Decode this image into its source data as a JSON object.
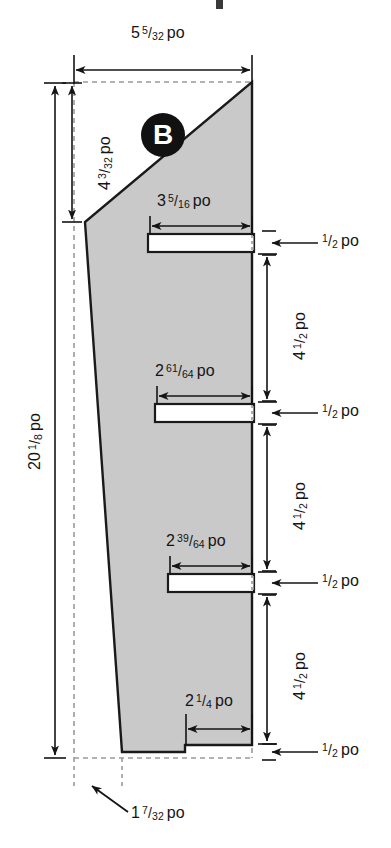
{
  "drawing": {
    "title": "",
    "part_label": "B",
    "unit": "po",
    "shape_fill": "#c9c9c9",
    "shape_stroke": "#1a1a1a",
    "hidden_line_color": "#9a9a9a",
    "dimension_color": "#141414",
    "badge_color": "#111111"
  },
  "dimensions": {
    "overall_width": {
      "whole": "5",
      "num": "5",
      "den": "32",
      "unit": "po",
      "text": "5 5/32 po"
    },
    "overall_height": {
      "whole": "20",
      "num": "1",
      "den": "8",
      "unit": "po",
      "text": "20 1/8 po"
    },
    "top_offset_height": {
      "whole": "4",
      "num": "3",
      "den": "32",
      "unit": "po",
      "text": "4 3/32 po"
    },
    "slot1_length": {
      "whole": "3",
      "num": "5",
      "den": "16",
      "unit": "po",
      "text": "3 5/16 po"
    },
    "slot2_length": {
      "whole": "2",
      "num": "61",
      "den": "64",
      "unit": "po",
      "text": "2 61/64 po"
    },
    "slot3_length": {
      "whole": "2",
      "num": "39",
      "den": "64",
      "unit": "po",
      "text": "2 39/64 po"
    },
    "notch_length": {
      "whole": "2",
      "num": "1",
      "den": "4",
      "unit": "po",
      "text": "2 1/4 po"
    },
    "bottom_offset": {
      "whole": "1",
      "num": "7",
      "den": "32",
      "unit": "po",
      "text": "1 7/32 po"
    },
    "slot_width_1": {
      "whole": "",
      "num": "1",
      "den": "2",
      "unit": "po",
      "text": "1/2 po"
    },
    "slot_width_2": {
      "whole": "",
      "num": "1",
      "den": "2",
      "unit": "po",
      "text": "1/2 po"
    },
    "slot_width_3": {
      "whole": "",
      "num": "1",
      "den": "2",
      "unit": "po",
      "text": "1/2 po"
    },
    "slot_width_4": {
      "whole": "",
      "num": "1",
      "den": "2",
      "unit": "po",
      "text": "1/2 po"
    },
    "spacing_1": {
      "whole": "4",
      "num": "1",
      "den": "2",
      "unit": "po",
      "text": "4 1/2 po"
    },
    "spacing_2": {
      "whole": "4",
      "num": "1",
      "den": "2",
      "unit": "po",
      "text": "4 1/2 po"
    },
    "spacing_3": {
      "whole": "4",
      "num": "1",
      "den": "2",
      "unit": "po",
      "text": "4 1/2 po"
    }
  }
}
